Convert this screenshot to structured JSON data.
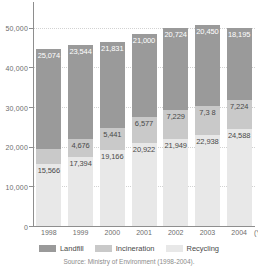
{
  "chart_data": {
    "type": "bar",
    "subtype": "stacked",
    "title": "",
    "xlabel": "(Year)",
    "ylabel": "",
    "categories": [
      "1998",
      "1999",
      "2000",
      "2001",
      "2002",
      "2003",
      "2004"
    ],
    "ylim": [
      0,
      55000
    ],
    "yticks": [
      0,
      10000,
      20000,
      30000,
      40000,
      50000
    ],
    "ytick_labels": [
      "0",
      "10,000",
      "20,000",
      "30,000",
      "40,000",
      "50,000"
    ],
    "grid": true,
    "legend_position": "bottom",
    "series": [
      {
        "name": "Recycling",
        "color": "#e8e8e8",
        "values": [
          15566,
          17394,
          19166,
          20922,
          21949,
          22938,
          24588
        ],
        "labels": [
          "15,566",
          "17,394",
          "19,166",
          "20,922",
          "21,949",
          "22,938",
          "24,588"
        ]
      },
      {
        "name": "Incineration",
        "color": "#c9c9c9",
        "values": [
          3943,
          4676,
          5441,
          6577,
          7229,
          7308,
          7224
        ],
        "labels": [
          "3,943",
          "4,676",
          "5,441",
          "6,577",
          "7,229",
          "7,3 8",
          "7,224"
        ]
      },
      {
        "name": "Landfill",
        "color": "#9a9a9a",
        "values": [
          25074,
          23544,
          21831,
          21000,
          20724,
          20450,
          18195
        ],
        "labels": [
          "25,074",
          "23,544",
          "21,831",
          "21,000",
          "20,724",
          "20,450",
          "18,195"
        ]
      }
    ],
    "totals": [
      44583,
      45614,
      46438,
      48499,
      49902,
      50696,
      50007
    ],
    "annotations": {
      "source": "Source: Ministry of Environment (1998-2004)."
    }
  },
  "axis": {
    "x_title": "(Year"
  },
  "legend": {
    "items": [
      {
        "label": "Landfill",
        "color": "#9a9a9a"
      },
      {
        "label": "Incineration",
        "color": "#c9c9c9"
      },
      {
        "label": "Recycling",
        "color": "#e8e8e8"
      }
    ]
  },
  "source_note": "Source: Ministry of Environment (1998-2004)."
}
